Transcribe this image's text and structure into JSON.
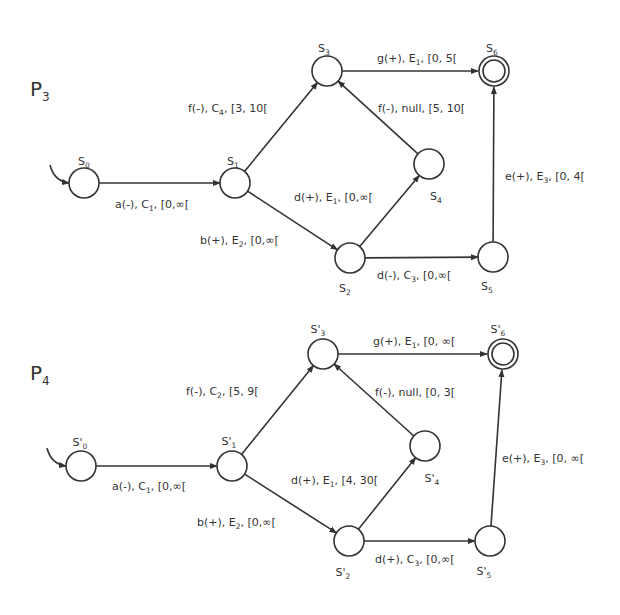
{
  "diagrams": [
    {
      "title": "P",
      "title_sub": "3",
      "states": [
        {
          "id": "S0",
          "label": "S",
          "sub": "0",
          "x": 84,
          "y": 183,
          "final": false,
          "initial": true,
          "lx": 84,
          "ly": 165
        },
        {
          "id": "S1",
          "label": "S",
          "sub": "1",
          "x": 235,
          "y": 183,
          "final": false,
          "initial": false,
          "lx": 233,
          "ly": 165
        },
        {
          "id": "S2",
          "label": "S",
          "sub": "2",
          "x": 350,
          "y": 258,
          "final": false,
          "initial": false,
          "lx": 345,
          "ly": 292
        },
        {
          "id": "S3",
          "label": "S",
          "sub": "3",
          "x": 327,
          "y": 71,
          "final": false,
          "initial": false,
          "lx": 324,
          "ly": 52
        },
        {
          "id": "S4",
          "label": "S",
          "sub": "4",
          "x": 429,
          "y": 164,
          "final": false,
          "initial": false,
          "lx": 436,
          "ly": 200
        },
        {
          "id": "S5",
          "label": "S",
          "sub": "5",
          "x": 493,
          "y": 257,
          "final": false,
          "initial": false,
          "lx": 487,
          "ly": 290
        },
        {
          "id": "S6",
          "label": "S",
          "sub": "6",
          "x": 494,
          "y": 71,
          "final": true,
          "initial": false,
          "lx": 492,
          "ly": 52
        }
      ],
      "transitions": [
        {
          "from": "S0",
          "to": "S1",
          "text": "a(-), C",
          "sub": "1",
          "rest": ", [0,∞[",
          "lx": 115,
          "ly": 208
        },
        {
          "from": "S1",
          "to": "S3",
          "text": "f(-), C",
          "sub": "4",
          "rest": ", [3, 10[",
          "lx": 188,
          "ly": 112
        },
        {
          "from": "S1",
          "to": "S2",
          "text": "b(+), E",
          "sub": "2",
          "rest": ", [0,∞[",
          "lx": 200,
          "ly": 244
        },
        {
          "from": "S2",
          "to": "S4",
          "text": "d(+), E",
          "sub": "1",
          "rest": ", [0,∞[",
          "lx": 294,
          "ly": 201
        },
        {
          "from": "S4",
          "to": "S3",
          "text": "f(-), null, [5, 10[",
          "sub": "",
          "rest": "",
          "lx": 378,
          "ly": 112
        },
        {
          "from": "S3",
          "to": "S6",
          "text": "g(+), E",
          "sub": "1",
          "rest": ", [0, 5[",
          "lx": 377,
          "ly": 62
        },
        {
          "from": "S2",
          "to": "S5",
          "text": "d(-), C",
          "sub": "3",
          "rest": ", [0,∞[",
          "lx": 377,
          "ly": 279
        },
        {
          "from": "S5",
          "to": "S6",
          "text": "e(+), E",
          "sub": "3",
          "rest": ", [0, 4[",
          "lx": 505,
          "ly": 180
        }
      ]
    },
    {
      "title": "P",
      "title_sub": "4",
      "states": [
        {
          "id": "S'0",
          "label": "S'",
          "sub": "0",
          "x": 81,
          "y": 466,
          "final": false,
          "initial": true,
          "lx": 80,
          "ly": 446
        },
        {
          "id": "S'1",
          "label": "S'",
          "sub": "1",
          "x": 232,
          "y": 466,
          "final": false,
          "initial": false,
          "lx": 229,
          "ly": 445
        },
        {
          "id": "S'2",
          "label": "S'",
          "sub": "2",
          "x": 349,
          "y": 541,
          "final": false,
          "initial": false,
          "lx": 343,
          "ly": 576
        },
        {
          "id": "S'3",
          "label": "S'",
          "sub": "3",
          "x": 323,
          "y": 354,
          "final": false,
          "initial": false,
          "lx": 318,
          "ly": 333
        },
        {
          "id": "S'4",
          "label": "S'",
          "sub": "4",
          "x": 425,
          "y": 446,
          "final": false,
          "initial": false,
          "lx": 432,
          "ly": 482
        },
        {
          "id": "S'5",
          "label": "S'",
          "sub": "5",
          "x": 490,
          "y": 541,
          "final": false,
          "initial": false,
          "lx": 484,
          "ly": 575
        },
        {
          "id": "S'6",
          "label": "S'",
          "sub": "6",
          "x": 503,
          "y": 354,
          "final": true,
          "initial": false,
          "lx": 498,
          "ly": 333
        },
        {
          "id": "_pad",
          "label": "",
          "sub": "",
          "x": -100,
          "y": -100,
          "final": false,
          "initial": false,
          "lx": -100,
          "ly": -100
        }
      ],
      "transitions": [
        {
          "from": "S'0",
          "to": "S'1",
          "text": "a(-), C",
          "sub": "1",
          "rest": ", [0,∞[",
          "lx": 112,
          "ly": 490
        },
        {
          "from": "S'1",
          "to": "S'3",
          "text": "f(-), C",
          "sub": "2",
          "rest": ", [5, 9[",
          "lx": 186,
          "ly": 395
        },
        {
          "from": "S'1",
          "to": "S'2",
          "text": "b(+), E",
          "sub": "2",
          "rest": ", [0,∞[",
          "lx": 197,
          "ly": 526
        },
        {
          "from": "S'2",
          "to": "S'4",
          "text": "d(+), E",
          "sub": "1",
          "rest": ", [4, 30[",
          "lx": 291,
          "ly": 484
        },
        {
          "from": "S'4",
          "to": "S'3",
          "text": "f(-), null, [0, 3[",
          "sub": "",
          "rest": "",
          "lx": 375,
          "ly": 396
        },
        {
          "from": "S'3",
          "to": "S'6",
          "text": "g(+), E",
          "sub": "1",
          "rest": ", [0, ∞[",
          "lx": 373,
          "ly": 345
        },
        {
          "from": "S'2",
          "to": "S'5",
          "text": "d(+), C",
          "sub": "3",
          "rest": ", [0,∞[",
          "lx": 375,
          "ly": 563
        },
        {
          "from": "S'5",
          "to": "S'6",
          "text": "e(+), E",
          "sub": "3",
          "rest": ", [0, ∞[",
          "lx": 502,
          "ly": 462
        }
      ]
    }
  ],
  "colors": {
    "stroke": "#333333",
    "background": "#ffffff"
  }
}
